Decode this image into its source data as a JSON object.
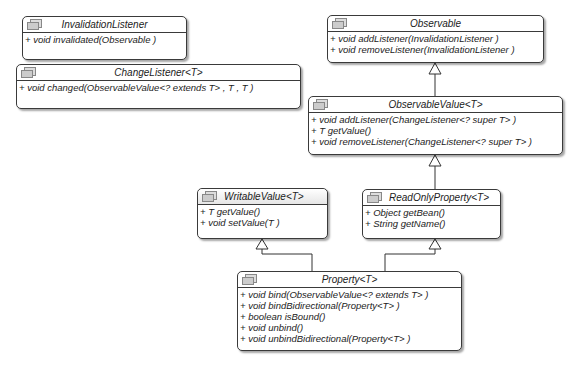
{
  "classes": {
    "invalidation_listener": {
      "name": "InvalidationListener",
      "ops": [
        "+ void invalidated(Observable )"
      ]
    },
    "change_listener": {
      "name": "ChangeListener<T>",
      "ops": [
        "+ void changed(ObservableValue<? extends T> , T , T )"
      ]
    },
    "observable": {
      "name": "Observable",
      "ops": [
        "+ void addListener(InvalidationListener )",
        "+ void removeListener(InvalidationListener )"
      ]
    },
    "observable_value": {
      "name": "ObservableValue<T>",
      "ops": [
        "+ void addListener(ChangeListener<? super T> )",
        "+ T getValue()",
        "+ void removeListener(ChangeListener<? super T> )"
      ]
    },
    "writable_value": {
      "name": "WritableValue<T>",
      "ops": [
        "+ T getValue()",
        "+ void setValue(T )"
      ]
    },
    "read_only_property": {
      "name": "ReadOnlyProperty<T>",
      "ops": [
        "+ Object getBean()",
        "+ String getName()"
      ]
    },
    "property": {
      "name": "Property<T>",
      "ops": [
        "+ void bind(ObservableValue<? extends T> )",
        "+ void bindBidirectional(Property<T> )",
        "+ boolean isBound()",
        "+ void unbind()",
        "+ void unbindBidirectional(Property<T> )"
      ]
    }
  },
  "relations": [
    {
      "from": "ObservableValue<T>",
      "to": "Observable",
      "type": "generalization"
    },
    {
      "from": "ReadOnlyProperty<T>",
      "to": "ObservableValue<T>",
      "type": "generalization"
    },
    {
      "from": "Property<T>",
      "to": "WritableValue<T>",
      "type": "generalization"
    },
    {
      "from": "Property<T>",
      "to": "ReadOnlyProperty<T>",
      "type": "generalization"
    }
  ]
}
